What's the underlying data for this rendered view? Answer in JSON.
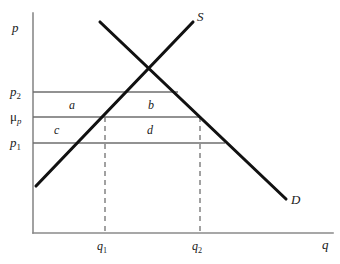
{
  "figure": {
    "type": "supply-demand-diagram",
    "background": "#ffffff",
    "curve_color": "#111111",
    "axis_color": "#8a8a8a",
    "price_line_color": "#6e6e6e",
    "dashed_color": "#7a7a7a",
    "text_color": "#1a1a1a"
  },
  "axes": {
    "y_label": "p",
    "x_label": "q",
    "origin": {
      "x": 33,
      "y": 233
    },
    "y_top": {
      "x": 33,
      "y": 13
    },
    "x_right": {
      "x": 333,
      "y": 233
    }
  },
  "curves": [
    {
      "name": "supply",
      "label": "S",
      "label_pos": {
        "x": 197,
        "y": 10
      },
      "from": {
        "x": 36,
        "y": 186
      },
      "to": {
        "x": 193,
        "y": 22
      }
    },
    {
      "name": "demand",
      "label": "D",
      "label_pos": {
        "x": 291,
        "y": 193
      },
      "from": {
        "x": 100,
        "y": 22
      },
      "to": {
        "x": 286,
        "y": 199
      }
    }
  ],
  "price_lines": [
    {
      "id": "p2",
      "label_main": "p",
      "label_sub": "2",
      "y": 92,
      "x_start": 33,
      "x_end": 178,
      "label_pos": {
        "x": 10,
        "y": 85
      }
    },
    {
      "id": "mu_p",
      "label_main": "μ",
      "label_sub": "p",
      "y": 117,
      "x_start": 33,
      "x_end": 201,
      "label_pos": {
        "x": 10,
        "y": 110
      }
    },
    {
      "id": "p1",
      "label_main": "p",
      "label_sub": "1",
      "y": 143,
      "x_start": 33,
      "x_end": 225,
      "label_pos": {
        "x": 10,
        "y": 136
      }
    }
  ],
  "quantity_lines": [
    {
      "id": "q1",
      "label_main": "q",
      "label_sub": "1",
      "x": 105,
      "y_top": 117,
      "y_bottom": 233,
      "tick_label_pos": {
        "x": 97,
        "y": 240
      }
    },
    {
      "id": "q2",
      "label_main": "q",
      "label_sub": "2",
      "x": 200,
      "y_top": 117,
      "y_bottom": 233,
      "tick_label_pos": {
        "x": 192,
        "y": 240
      }
    }
  ],
  "regions": [
    {
      "id": "a",
      "label": "a",
      "pos": {
        "x": 69,
        "y": 99
      }
    },
    {
      "id": "b",
      "label": "b",
      "pos": {
        "x": 148,
        "y": 99
      }
    },
    {
      "id": "c",
      "label": "c",
      "pos": {
        "x": 54,
        "y": 124
      }
    },
    {
      "id": "d",
      "label": "d",
      "pos": {
        "x": 147,
        "y": 124
      }
    }
  ]
}
